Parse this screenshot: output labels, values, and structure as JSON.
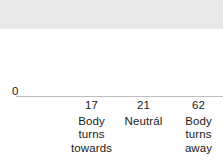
{
  "chart_data": {
    "type": "bar",
    "title": "",
    "subtitle": "",
    "xlabel": "",
    "ylabel": "",
    "categories": [
      "Body turns towards",
      "Neutrál",
      "Body turns away"
    ],
    "category_lines": [
      [
        "Body",
        "turns",
        "towards"
      ],
      [
        "Neutrál"
      ],
      [
        "Body",
        "turns",
        "away"
      ]
    ],
    "values": [
      17,
      21,
      62
    ],
    "value_labels": [
      "17",
      "21",
      "62"
    ],
    "ylim": [
      0,
      69
    ],
    "yticks": [
      0,
      50
    ],
    "ytick_labels": [
      "0",
      "50"
    ],
    "grid": true,
    "legend": "none",
    "bar_color": "#e8e8e8",
    "gridline_color": "#c9c9c9",
    "baseline_color": "#bdbdbd",
    "text_color": "#1a1a1a",
    "background": "#ffffff"
  }
}
